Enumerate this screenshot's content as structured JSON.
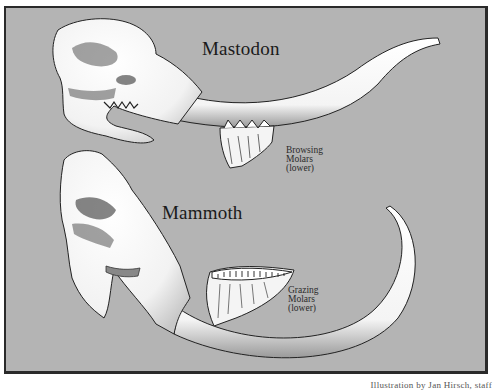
{
  "figure": {
    "background_color": "#b4b4b4",
    "border_color": "#2a2a2a",
    "specimens": [
      {
        "name": "Mastodon",
        "molar_label": [
          "Browsing",
          "Molars",
          "(lower)"
        ],
        "tusk_shape": "gently curved, upturned at tip"
      },
      {
        "name": "Mammoth",
        "molar_label": [
          "Grazing",
          "Molars",
          "(lower)"
        ],
        "tusk_shape": "long, strongly curved upward"
      }
    ],
    "credit": "Illustration by Jan Hirsch, staff"
  }
}
